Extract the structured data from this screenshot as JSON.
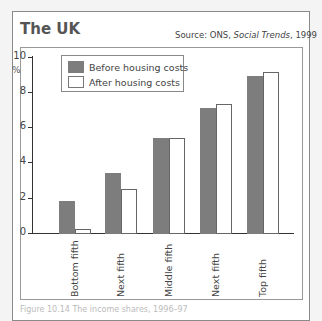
{
  "header": {
    "title": "The UK",
    "source_prefix": "Source: ONS, ",
    "source_italic": "Social Trends",
    "source_suffix": ", 1999"
  },
  "footer": {
    "caption": "Figure 10.14  The income shares, 1996–97"
  },
  "colors": {
    "before": "#7d7d7d",
    "after": "#ffffff"
  },
  "chart_data": {
    "type": "bar",
    "title": "The UK",
    "subtitle": "Source: ONS, Social Trends, 1999",
    "xlabel": "",
    "ylabel": "%",
    "ylim": [
      0,
      10
    ],
    "yticks": [
      0,
      2,
      4,
      6,
      8,
      10
    ],
    "grid": false,
    "legend_position": "top-left",
    "categories": [
      "Bottom fifth",
      "Next fifth",
      "Middle fifth",
      "Next fifth",
      "Top fifth"
    ],
    "series": [
      {
        "name": "Before housing costs",
        "values": [
          1.8,
          3.4,
          5.4,
          7.1,
          8.9
        ]
      },
      {
        "name": "After housing costs",
        "values": [
          0.2,
          2.5,
          5.4,
          7.3,
          9.1
        ]
      }
    ]
  }
}
